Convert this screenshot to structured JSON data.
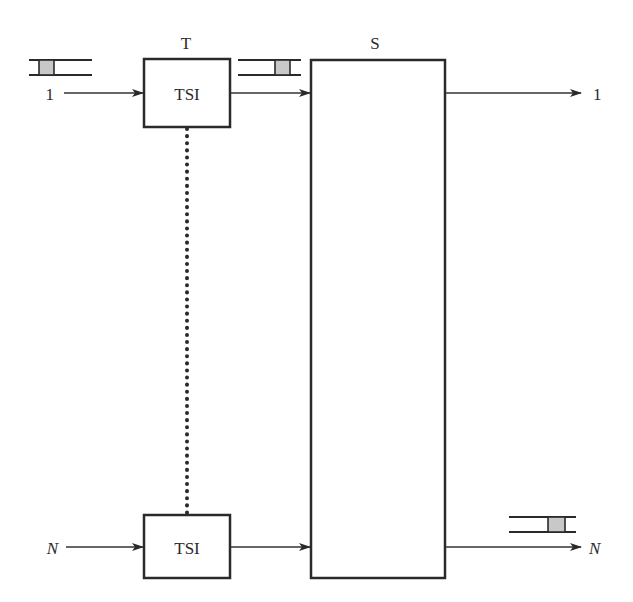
{
  "diagram": {
    "title_t": "T",
    "title_s": "S",
    "tsi_top": {
      "label": "TSI"
    },
    "tsi_bottom": {
      "label": "TSI"
    },
    "inputs": [
      {
        "label": "1"
      },
      {
        "label": "N"
      }
    ],
    "outputs": [
      {
        "label": "1"
      },
      {
        "label": "N"
      }
    ],
    "colors": {
      "stroke": "#2a2a2a",
      "slot_fill": "#c8c8c8",
      "background": "#ffffff"
    }
  }
}
